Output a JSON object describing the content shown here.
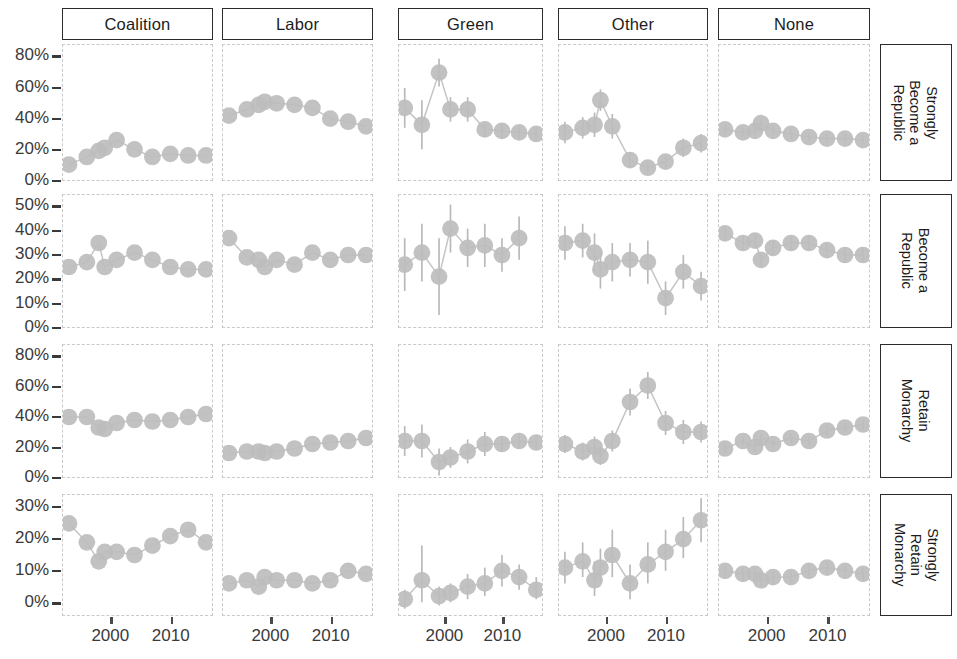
{
  "figure": {
    "columns": [
      "Coalition",
      "Labor",
      "Green",
      "Other",
      "None"
    ],
    "rows": [
      "Strongly Become a Republic",
      "Become a Republic",
      "Retain Monarchy",
      "Strongly Retain Monarchy"
    ],
    "row_label_lines": [
      [
        "Strongly",
        "Become a",
        "Republic"
      ],
      [
        "Become a",
        "Republic"
      ],
      [
        "Retain",
        "Monarchy"
      ],
      [
        "Strongly",
        "Retain",
        "Monarchy"
      ]
    ],
    "x_tick_labels": [
      "2000",
      "2010"
    ],
    "colors": {
      "point": "#bdbdbd",
      "errorbar": "#b9b9b9",
      "line": "#c4c4c4",
      "strip_border": "#2b2b2b",
      "panel_border": "#c9c9c9",
      "text": "#3a3a3a"
    }
  },
  "chart_data": {
    "type": "line",
    "title": "",
    "xlabel": "",
    "ylabel": "",
    "grid": false,
    "legend": "none",
    "facet_layout": "5 columns (party identification) x 4 rows (republic/monarchy preference)",
    "facet_cols": [
      "Coalition",
      "Labor",
      "Green",
      "Other",
      "None"
    ],
    "facet_rows": [
      "Strongly Become a Republic",
      "Become a Republic",
      "Retain Monarchy",
      "Strongly Retain Monarchy"
    ],
    "xlim": [
      1992,
      2017
    ],
    "x_ticks": [
      2000,
      2010
    ],
    "row_axes": [
      {
        "row": "Strongly Become a Republic",
        "ylim": [
          0,
          88
        ],
        "y_ticks": [
          0,
          20,
          40,
          60,
          80
        ],
        "y_tick_labels": [
          "0%",
          "20%",
          "40%",
          "60%",
          "80%"
        ]
      },
      {
        "row": "Become a Republic",
        "ylim": [
          0,
          55
        ],
        "y_ticks": [
          0,
          10,
          20,
          30,
          40,
          50
        ],
        "y_tick_labels": [
          "0%",
          "10%",
          "20%",
          "30%",
          "40%",
          "50%"
        ]
      },
      {
        "row": "Retain Monarchy",
        "ylim": [
          0,
          88
        ],
        "y_ticks": [
          0,
          20,
          40,
          60,
          80
        ],
        "y_tick_labels": [
          "0%",
          "20%",
          "40%",
          "60%",
          "80%"
        ]
      },
      {
        "row": "Strongly Retain Monarchy",
        "ylim": [
          -4,
          34
        ],
        "y_ticks": [
          0,
          10,
          20,
          30
        ],
        "y_tick_labels": [
          "0%",
          "10%",
          "20%",
          "30%"
        ]
      }
    ],
    "panels": [
      {
        "row": "Strongly Become a Republic",
        "col": "Coalition",
        "x": [
          1993,
          1996,
          1998,
          1999,
          2001,
          2004,
          2007,
          2010,
          2013,
          2016
        ],
        "y": [
          10,
          15,
          19,
          21,
          26,
          20,
          15,
          17,
          16,
          16
        ],
        "ylo": [
          9,
          14,
          18,
          20,
          25,
          19,
          14,
          16,
          15,
          15
        ],
        "yhi": [
          11,
          16,
          20,
          22,
          27,
          21,
          16,
          18,
          17,
          17
        ]
      },
      {
        "row": "Strongly Become a Republic",
        "col": "Labor",
        "x": [
          1993,
          1996,
          1998,
          1999,
          2001,
          2004,
          2007,
          2010,
          2013,
          2016
        ],
        "y": [
          42,
          46,
          49,
          51,
          50,
          49,
          47,
          40,
          38,
          35
        ],
        "ylo": [
          41,
          45,
          48,
          50,
          49,
          48,
          46,
          39,
          37,
          34
        ],
        "yhi": [
          43,
          47,
          50,
          52,
          51,
          50,
          48,
          41,
          39,
          36
        ]
      },
      {
        "row": "Strongly Become a Republic",
        "col": "Green",
        "x": [
          1993,
          1996,
          1999,
          2001,
          2004,
          2007,
          2010,
          2013,
          2016
        ],
        "y": [
          47,
          36,
          70,
          46,
          46,
          33,
          32,
          31,
          30
        ],
        "ylo": [
          34,
          20,
          61,
          38,
          38,
          28,
          27,
          27,
          26
        ],
        "yhi": [
          60,
          52,
          79,
          54,
          54,
          38,
          37,
          35,
          34
        ]
      },
      {
        "row": "Strongly Become a Republic",
        "col": "Other",
        "x": [
          1993,
          1996,
          1998,
          1999,
          2001,
          2004,
          2007,
          2010,
          2013,
          2016
        ],
        "y": [
          31,
          34,
          36,
          52,
          35,
          13,
          8,
          12,
          21,
          24
        ],
        "ylo": [
          24,
          27,
          28,
          45,
          27,
          8,
          4,
          7,
          15,
          18
        ],
        "yhi": [
          38,
          41,
          44,
          59,
          43,
          18,
          12,
          17,
          27,
          30
        ]
      },
      {
        "row": "Strongly Become a Republic",
        "col": "None",
        "x": [
          1993,
          1996,
          1998,
          1999,
          2001,
          2004,
          2007,
          2010,
          2013,
          2016
        ],
        "y": [
          33,
          31,
          32,
          37,
          32,
          30,
          28,
          27,
          27,
          26
        ],
        "ylo": [
          30,
          28,
          29,
          34,
          29,
          27,
          25,
          24,
          24,
          23
        ],
        "yhi": [
          36,
          34,
          35,
          40,
          35,
          33,
          31,
          30,
          30,
          29
        ]
      },
      {
        "row": "Become a Republic",
        "col": "Coalition",
        "x": [
          1993,
          1996,
          1998,
          1999,
          2001,
          2004,
          2007,
          2010,
          2013,
          2016
        ],
        "y": [
          25,
          27,
          35,
          25,
          28,
          31,
          28,
          25,
          24,
          24
        ],
        "ylo": [
          24,
          26,
          34,
          24,
          27,
          30,
          27,
          24,
          23,
          23
        ],
        "yhi": [
          26,
          28,
          36,
          26,
          29,
          32,
          29,
          26,
          25,
          25
        ]
      },
      {
        "row": "Become a Republic",
        "col": "Labor",
        "x": [
          1993,
          1996,
          1998,
          1999,
          2001,
          2004,
          2007,
          2010,
          2013,
          2016
        ],
        "y": [
          37,
          29,
          28,
          25,
          28,
          26,
          31,
          28,
          30,
          30
        ],
        "ylo": [
          36,
          28,
          27,
          24,
          27,
          25,
          30,
          27,
          29,
          29
        ],
        "yhi": [
          38,
          30,
          29,
          26,
          29,
          27,
          32,
          29,
          31,
          31
        ]
      },
      {
        "row": "Become a Republic",
        "col": "Green",
        "x": [
          1993,
          1996,
          1999,
          2001,
          2004,
          2007,
          2010,
          2013
        ],
        "y": [
          26,
          31,
          21,
          41,
          33,
          34,
          30,
          37
        ],
        "ylo": [
          15,
          19,
          5,
          31,
          25,
          25,
          23,
          28
        ],
        "yhi": [
          37,
          43,
          37,
          51,
          41,
          43,
          37,
          46
        ]
      },
      {
        "row": "Become a Republic",
        "col": "Other",
        "x": [
          1993,
          1996,
          1998,
          1999,
          2001,
          2004,
          2007,
          2010,
          2013,
          2016
        ],
        "y": [
          35,
          36,
          31,
          24,
          27,
          28,
          27,
          12,
          23,
          17
        ],
        "ylo": [
          28,
          29,
          23,
          16,
          19,
          21,
          18,
          5,
          16,
          11
        ],
        "yhi": [
          42,
          43,
          39,
          32,
          35,
          35,
          36,
          19,
          30,
          23
        ]
      },
      {
        "row": "Become a Republic",
        "col": "None",
        "x": [
          1993,
          1996,
          1998,
          1999,
          2001,
          2004,
          2007,
          2010,
          2013,
          2016
        ],
        "y": [
          39,
          35,
          36,
          28,
          33,
          35,
          35,
          32,
          30,
          30
        ],
        "ylo": [
          36,
          32,
          33,
          25,
          30,
          32,
          32,
          29,
          27,
          27
        ],
        "yhi": [
          42,
          38,
          39,
          31,
          36,
          38,
          38,
          35,
          33,
          33
        ]
      },
      {
        "row": "Retain Monarchy",
        "col": "Coalition",
        "x": [
          1993,
          1996,
          1998,
          1999,
          2001,
          2004,
          2007,
          2010,
          2013,
          2016
        ],
        "y": [
          40,
          40,
          33,
          32,
          36,
          38,
          37,
          38,
          40,
          42
        ],
        "ylo": [
          39,
          39,
          32,
          31,
          35,
          37,
          36,
          37,
          39,
          41
        ],
        "yhi": [
          41,
          41,
          34,
          33,
          37,
          39,
          38,
          39,
          41,
          43
        ]
      },
      {
        "row": "Retain Monarchy",
        "col": "Labor",
        "x": [
          1993,
          1996,
          1998,
          1999,
          2001,
          2004,
          2007,
          2010,
          2013,
          2016
        ],
        "y": [
          16,
          17,
          17,
          16,
          17,
          19,
          22,
          23,
          24,
          26
        ],
        "ylo": [
          15,
          16,
          16,
          15,
          16,
          18,
          21,
          22,
          23,
          25
        ],
        "yhi": [
          17,
          18,
          18,
          17,
          18,
          20,
          23,
          24,
          25,
          27
        ]
      },
      {
        "row": "Retain Monarchy",
        "col": "Green",
        "x": [
          1993,
          1996,
          1999,
          2001,
          2004,
          2007,
          2010,
          2013,
          2016
        ],
        "y": [
          24,
          24,
          10,
          13,
          17,
          22,
          22,
          24,
          23
        ],
        "ylo": [
          14,
          13,
          1,
          6,
          9,
          14,
          17,
          19,
          18
        ],
        "yhi": [
          34,
          35,
          19,
          20,
          25,
          30,
          27,
          29,
          28
        ]
      },
      {
        "row": "Retain Monarchy",
        "col": "Other",
        "x": [
          1993,
          1996,
          1998,
          1999,
          2001,
          2004,
          2007,
          2010,
          2013,
          2016
        ],
        "y": [
          22,
          17,
          20,
          14,
          24,
          50,
          61,
          36,
          30,
          30
        ],
        "ylo": [
          16,
          11,
          13,
          8,
          17,
          41,
          52,
          28,
          22,
          23
        ],
        "yhi": [
          28,
          23,
          27,
          20,
          31,
          59,
          70,
          44,
          38,
          37
        ]
      },
      {
        "row": "Retain Monarchy",
        "col": "None",
        "x": [
          1993,
          1996,
          1998,
          1999,
          2001,
          2004,
          2007,
          2010,
          2013,
          2016
        ],
        "y": [
          19,
          24,
          20,
          26,
          22,
          26,
          24,
          31,
          33,
          35
        ],
        "ylo": [
          16,
          21,
          17,
          23,
          19,
          23,
          21,
          28,
          30,
          32
        ],
        "yhi": [
          22,
          27,
          23,
          29,
          25,
          29,
          27,
          34,
          36,
          38
        ]
      },
      {
        "row": "Strongly Retain Monarchy",
        "col": "Coalition",
        "x": [
          1993,
          1996,
          1998,
          1999,
          2001,
          2004,
          2007,
          2010,
          2013,
          2016
        ],
        "y": [
          25,
          19,
          13,
          16,
          16,
          15,
          18,
          21,
          23,
          19
        ],
        "ylo": [
          24,
          18,
          12,
          15,
          15,
          14,
          17,
          20,
          22,
          18
        ],
        "yhi": [
          26,
          20,
          14,
          17,
          17,
          16,
          19,
          22,
          24,
          20
        ]
      },
      {
        "row": "Strongly Retain Monarchy",
        "col": "Labor",
        "x": [
          1993,
          1996,
          1998,
          1999,
          2001,
          2004,
          2007,
          2010,
          2013,
          2016
        ],
        "y": [
          6,
          7,
          5,
          8,
          7,
          7,
          6,
          7,
          10,
          9
        ],
        "ylo": [
          5,
          6,
          4,
          7,
          6,
          6,
          5,
          6,
          9,
          8
        ],
        "yhi": [
          7,
          8,
          6,
          9,
          8,
          8,
          7,
          8,
          11,
          10
        ]
      },
      {
        "row": "Strongly Retain Monarchy",
        "col": "Green",
        "x": [
          1993,
          1996,
          1999,
          2001,
          2004,
          2007,
          2010,
          2013,
          2016
        ],
        "y": [
          1,
          7,
          2,
          3,
          5,
          6,
          10,
          8,
          4
        ],
        "ylo": [
          -2,
          0,
          -1,
          0,
          1,
          2,
          5,
          4,
          1
        ],
        "yhi": [
          4,
          18,
          5,
          6,
          9,
          11,
          15,
          12,
          8
        ]
      },
      {
        "row": "Strongly Retain Monarchy",
        "col": "Other",
        "x": [
          1993,
          1996,
          1998,
          1999,
          2001,
          2004,
          2007,
          2010,
          2013,
          2016
        ],
        "y": [
          11,
          13,
          7,
          11,
          15,
          6,
          12,
          16,
          20,
          26
        ],
        "ylo": [
          6,
          8,
          2,
          6,
          8,
          1,
          6,
          10,
          14,
          19
        ],
        "yhi": [
          16,
          19,
          13,
          17,
          23,
          12,
          19,
          23,
          27,
          33
        ]
      },
      {
        "row": "Strongly Retain Monarchy",
        "col": "None",
        "x": [
          1993,
          1996,
          1998,
          1999,
          2001,
          2004,
          2007,
          2010,
          2013,
          2016
        ],
        "y": [
          10,
          9,
          9,
          7,
          8,
          8,
          10,
          11,
          10,
          9
        ],
        "ylo": [
          8,
          7,
          7,
          5,
          6,
          6,
          8,
          9,
          8,
          7
        ],
        "yhi": [
          12,
          11,
          11,
          9,
          10,
          10,
          12,
          13,
          12,
          11
        ]
      }
    ]
  }
}
